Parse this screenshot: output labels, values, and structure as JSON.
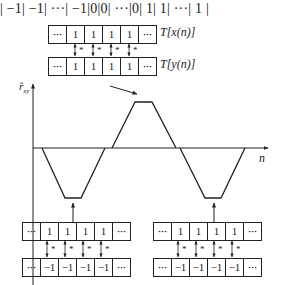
{
  "top_sequence": [
    "| −1 ",
    "| −1 ",
    "| ··· ",
    "| −1 ",
    "|0 ",
    "|0 ",
    "| ··· ",
    "|0 ",
    "| 1 ",
    "| 1 ",
    " | ··· ",
    "| 1 |"
  ],
  "top_group": {
    "row_x": [
      "···",
      "1",
      "1",
      "1",
      "1",
      "···"
    ],
    "row_y": [
      "···",
      "1",
      "1",
      "1",
      "1",
      "···"
    ],
    "label_x": "T[x(n)]",
    "label_y": "T[y(n)]",
    "op_symbol": "*"
  },
  "bottom_left_group": {
    "row_top": [
      "···",
      "1",
      "1",
      "1",
      "1",
      "···"
    ],
    "row_bottom": [
      "···",
      "−1",
      "−1",
      "−1",
      "−1",
      "···"
    ],
    "op_symbol": "*"
  },
  "bottom_right_group": {
    "row_top": [
      "···",
      "1",
      "1",
      "1",
      "1",
      "···"
    ],
    "row_bottom": [
      "···",
      "−1",
      "−1",
      "−1",
      "−1",
      "···"
    ],
    "op_symbol": "*"
  },
  "axes": {
    "y_label_main": "r̂",
    "y_label_sub": "xy",
    "x_label": "n"
  },
  "colors": {
    "line": "#222222",
    "background": "#ffffff"
  }
}
